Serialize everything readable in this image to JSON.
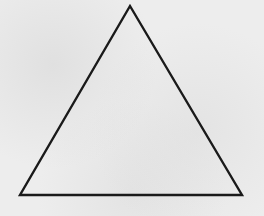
{
  "figure": {
    "shape": "triangle",
    "kind": "equilateral-triangle",
    "vertices": [
      {
        "name": "apex",
        "x": 130,
        "y": 6
      },
      {
        "name": "bottom-left",
        "x": 20,
        "y": 195
      },
      {
        "name": "bottom-right",
        "x": 242,
        "y": 195
      }
    ],
    "points": "130,6 20,195 242,195",
    "stroke_color": "#1a1a1a",
    "stroke_width": "2.4",
    "fill_color": "none",
    "background_color": "#ededed"
  }
}
